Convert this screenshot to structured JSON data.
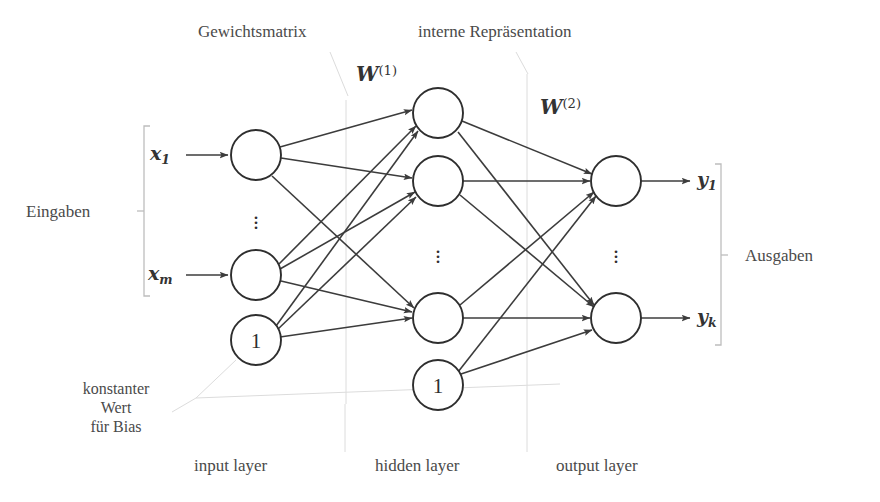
{
  "diagram": {
    "title_type": "feed-forward neural network (Mehrschichtiges Perzeptron)",
    "annotations": {
      "weight_matrix": "Gewichtsmatrix",
      "internal_representation": "interne Repräsentation",
      "bias_note_line1": "konstanter",
      "bias_note_line2": "Wert",
      "bias_note_line3": "für Bias"
    },
    "side_labels": {
      "inputs": "Eingaben",
      "outputs": "Ausgaben"
    },
    "layer_labels": {
      "input": "input layer",
      "hidden": "hidden layer",
      "output": "output layer"
    },
    "weights": {
      "w1_base": "W",
      "w1_sup": "(1)",
      "w2_base": "W",
      "w2_sup": "(2)"
    },
    "inputs": [
      {
        "base": "x",
        "sub": "1"
      },
      {
        "base": "x",
        "sub": "m"
      }
    ],
    "outputs": [
      {
        "base": "y",
        "sub": "1"
      },
      {
        "base": "y",
        "sub": "k"
      }
    ],
    "bias_value": "1",
    "ellipsis_glyph": "⋮",
    "colors": {
      "stroke": "#3c3c3c",
      "node_stroke": "#2e2e2e",
      "leader": "#d8d8d8",
      "bracket": "#bdbdbd",
      "text": "#4a4a4a",
      "background": "#ffffff"
    },
    "nodes": {
      "input_layer": [
        {
          "name": "x1",
          "cx": 256,
          "cy": 155,
          "r": 25
        },
        {
          "name": "xm",
          "cx": 256,
          "cy": 275,
          "r": 25
        },
        {
          "name": "bias",
          "cx": 256,
          "cy": 340,
          "r": 25,
          "label": "1"
        }
      ],
      "hidden_layer": [
        {
          "name": "h1",
          "cx": 438,
          "cy": 113,
          "r": 25
        },
        {
          "name": "h2",
          "cx": 438,
          "cy": 181,
          "r": 25
        },
        {
          "name": "h3",
          "cx": 438,
          "cy": 318,
          "r": 25
        },
        {
          "name": "bias",
          "cx": 438,
          "cy": 385,
          "r": 25,
          "label": "1"
        }
      ],
      "output_layer": [
        {
          "name": "y1",
          "cx": 616,
          "cy": 181,
          "r": 25
        },
        {
          "name": "yk",
          "cx": 616,
          "cy": 318,
          "r": 25
        }
      ]
    }
  }
}
